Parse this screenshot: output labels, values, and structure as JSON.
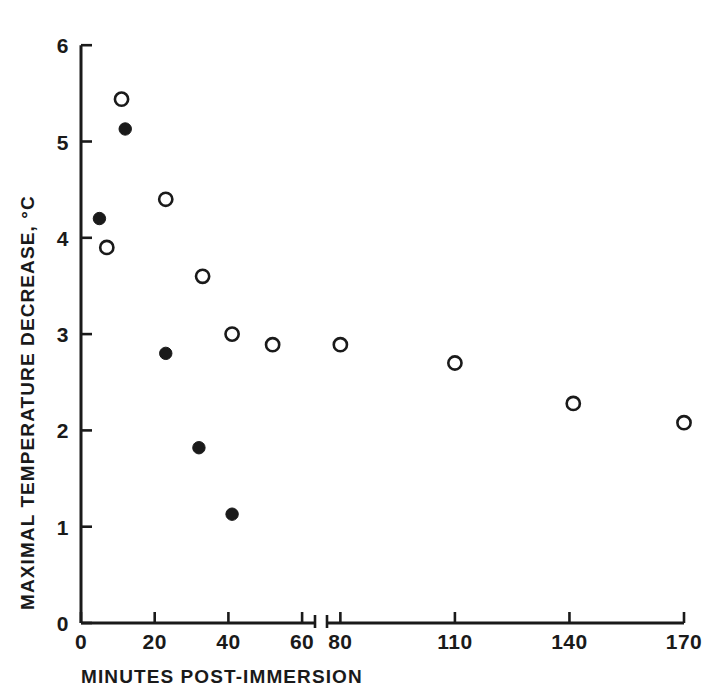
{
  "chart_data": {
    "type": "scatter",
    "title": "",
    "xlabel": "MINUTES POST-IMMERSION",
    "ylabel": "MAXIMAL TEMPERATURE DECREASE, °C",
    "xlim": [
      0,
      170
    ],
    "ylim": [
      0,
      6
    ],
    "grid": false,
    "legend": "none",
    "axis_break": {
      "present": true,
      "between": [
        60,
        80
      ],
      "note": "x-axis is broken between 60 and 80 minutes"
    },
    "xticks": [
      {
        "value": 0,
        "label": "0",
        "segment": "left"
      },
      {
        "value": 20,
        "label": "20",
        "segment": "left"
      },
      {
        "value": 40,
        "label": "40",
        "segment": "left"
      },
      {
        "value": 60,
        "label": "60",
        "segment": "left"
      },
      {
        "value": 80,
        "label": "80",
        "segment": "right"
      },
      {
        "value": 110,
        "label": "110",
        "segment": "right"
      },
      {
        "value": 140,
        "label": "140",
        "segment": "right"
      },
      {
        "value": 170,
        "label": "170",
        "segment": "right"
      }
    ],
    "yticks": [
      {
        "value": 0,
        "label": "0"
      },
      {
        "value": 1,
        "label": "1"
      },
      {
        "value": 2,
        "label": "2"
      },
      {
        "value": 3,
        "label": "3"
      },
      {
        "value": 4,
        "label": "4"
      },
      {
        "value": 5,
        "label": "5"
      },
      {
        "value": 6,
        "label": "6"
      }
    ],
    "series": [
      {
        "name": "open-circles",
        "marker": "open-circle",
        "color": "#1a1a1a",
        "points": [
          {
            "x": 7,
            "y": 3.9
          },
          {
            "x": 11,
            "y": 5.44
          },
          {
            "x": 23,
            "y": 4.4
          },
          {
            "x": 33,
            "y": 3.6
          },
          {
            "x": 41,
            "y": 3.0
          },
          {
            "x": 52,
            "y": 2.89
          },
          {
            "x": 80,
            "y": 2.89
          },
          {
            "x": 110,
            "y": 2.7
          },
          {
            "x": 141,
            "y": 2.28
          },
          {
            "x": 170,
            "y": 2.08
          }
        ]
      },
      {
        "name": "filled-circles",
        "marker": "filled-circle",
        "color": "#1a1a1a",
        "points": [
          {
            "x": 5,
            "y": 4.2
          },
          {
            "x": 12,
            "y": 5.13
          },
          {
            "x": 23,
            "y": 2.8
          },
          {
            "x": 32,
            "y": 1.82
          },
          {
            "x": 41,
            "y": 1.13
          }
        ]
      }
    ]
  },
  "geometry": {
    "origin_x": 81,
    "origin_y": 623,
    "y_unit_px": 96.3,
    "left_seg": {
      "x_start_px": 81,
      "x_end_px": 315,
      "v_start": 0,
      "v_end": 63.5
    },
    "right_seg": {
      "x_start_px": 327,
      "x_end_px": 684,
      "v_start": 76.5,
      "v_end": 170
    },
    "tick_len": 11,
    "marker_radius": 6.6
  }
}
